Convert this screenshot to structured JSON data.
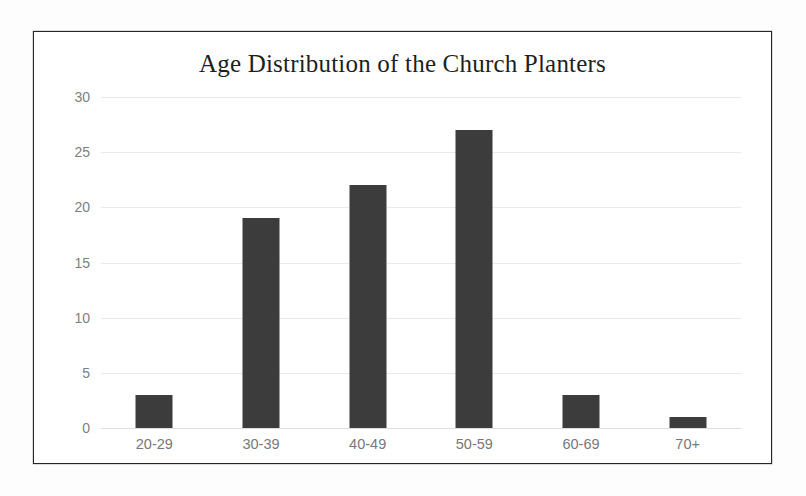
{
  "chart_data": {
    "type": "bar",
    "title": "Age Distribution of the Church Planters",
    "categories": [
      "20-29",
      "30-39",
      "40-49",
      "50-59",
      "60-69",
      "70+"
    ],
    "values": [
      3,
      19,
      22,
      27,
      3,
      1
    ],
    "xlabel": "",
    "ylabel": "",
    "ylim": [
      0,
      30
    ],
    "yticks": [
      0,
      5,
      10,
      15,
      20,
      25,
      30
    ],
    "ytick_labels": [
      "0",
      "5",
      "10",
      "15",
      "20",
      "25",
      "30"
    ],
    "grid": true,
    "legend": false,
    "bar_color": "#3c3c3c",
    "gridline_color": "#e9eaea",
    "tick_label_color": "#7d7f81",
    "frame_color": "#23262b",
    "background_color": "#ffffff"
  }
}
